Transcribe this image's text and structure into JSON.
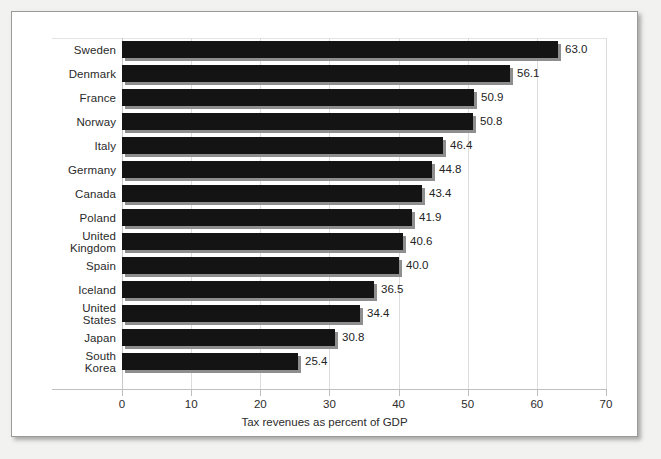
{
  "chart_data": {
    "type": "bar",
    "orientation": "horizontal",
    "title": "",
    "subtitle": "",
    "xlabel": "Tax revenues as percent of GDP",
    "ylabel": "",
    "xlim": [
      0,
      70
    ],
    "xticks": [
      0,
      10,
      20,
      30,
      40,
      50,
      60,
      70
    ],
    "xtick_labels": [
      "0",
      "10",
      "20",
      "30",
      "40",
      "50",
      "60",
      "70"
    ],
    "grid": true,
    "grid_axis": "x",
    "legend": false,
    "legend_position": "none",
    "bar_style": "3d-shadow",
    "bar_color": "#141414",
    "bar_shadow_color": "#8e8e8e",
    "categories": [
      "Sweden",
      "Denmark",
      "France",
      "Norway",
      "Italy",
      "Germany",
      "Canada",
      "Poland",
      "United Kingdom",
      "Spain",
      "Iceland",
      "United States",
      "Japan",
      "South Korea"
    ],
    "category_lines": [
      [
        "Sweden"
      ],
      [
        "Denmark"
      ],
      [
        "France"
      ],
      [
        "Norway"
      ],
      [
        "Italy"
      ],
      [
        "Germany"
      ],
      [
        "Canada"
      ],
      [
        "Poland"
      ],
      [
        "United",
        "Kingdom"
      ],
      [
        "Spain"
      ],
      [
        "Iceland"
      ],
      [
        "United",
        "States"
      ],
      [
        "Japan"
      ],
      [
        "South",
        "Korea"
      ]
    ],
    "values": [
      63.0,
      56.1,
      50.9,
      50.8,
      46.4,
      44.8,
      43.4,
      41.9,
      40.6,
      40.0,
      36.5,
      34.4,
      30.8,
      25.4
    ],
    "value_labels": [
      "63.0",
      "56.1",
      "50.9",
      "50.8",
      "46.4",
      "44.8",
      "43.4",
      "41.9",
      "40.6",
      "40.0",
      "36.5",
      "34.4",
      "30.8",
      "25.4"
    ]
  },
  "colors": {
    "page_background": "#f2f2f0",
    "frame_background": "#ffffff",
    "frame_border": "#9a9a9a",
    "bar": "#141414",
    "bar_shadow": "#8e8e8e",
    "gridline": "#dcdcdc",
    "axis_line": "#c0c0c0",
    "text": "#2a2a2a"
  }
}
